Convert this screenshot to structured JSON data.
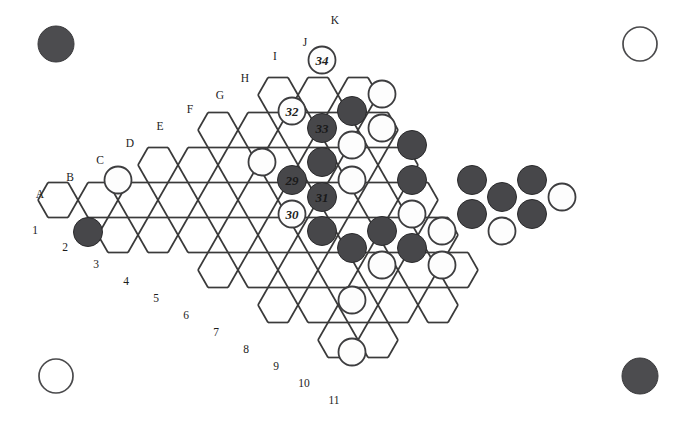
{
  "board": {
    "title": "Hexagonal board game position",
    "geometry": {
      "hex_width": 40,
      "hex_height": 35,
      "origin_x": 58,
      "origin_y": 200,
      "rows": 11,
      "row_lengths": [
        1,
        3,
        5,
        7,
        9,
        11,
        13,
        15,
        17,
        15,
        13
      ]
    },
    "column_labels": [
      "A",
      "B",
      "C",
      "D",
      "E",
      "F",
      "G",
      "H",
      "I",
      "J",
      "K"
    ],
    "row_labels": [
      "1",
      "2",
      "3",
      "4",
      "5",
      "6",
      "7",
      "8",
      "9",
      "10",
      "11"
    ],
    "colors": {
      "black_stone": "#47474a",
      "white_stone": "#fdfdfd",
      "grid_line": "#b9b9b9",
      "outline": "#3a3a3a",
      "background": "#ffffff"
    },
    "corner_markers": [
      {
        "name": "top-left-corner-stone",
        "color": "black",
        "cx": 56,
        "cy": 44,
        "r": 18
      },
      {
        "name": "top-right-corner-stone",
        "color": "white",
        "cx": 640,
        "cy": 44,
        "r": 17
      },
      {
        "name": "bottom-left-corner-stone",
        "color": "white",
        "cx": 56,
        "cy": 376,
        "r": 17
      },
      {
        "name": "bottom-right-corner-stone",
        "color": "black",
        "cx": 640,
        "cy": 376,
        "r": 18
      }
    ],
    "stones": [
      {
        "id": "s1",
        "color": "white",
        "label": "",
        "cx": 118,
        "cy": 180
      },
      {
        "id": "s2",
        "color": "black",
        "label": "",
        "cx": 88,
        "cy": 232
      },
      {
        "id": "s3",
        "color": "white",
        "label": "34",
        "cx": 322,
        "cy": 60
      },
      {
        "id": "s4",
        "color": "white",
        "label": "",
        "cx": 382,
        "cy": 94
      },
      {
        "id": "s5",
        "color": "white",
        "label": "32",
        "cx": 292,
        "cy": 111
      },
      {
        "id": "s6",
        "color": "black",
        "label": "33",
        "cx": 322,
        "cy": 128
      },
      {
        "id": "s7",
        "color": "black",
        "label": "",
        "cx": 352,
        "cy": 111
      },
      {
        "id": "s8",
        "color": "white",
        "label": "",
        "cx": 382,
        "cy": 128
      },
      {
        "id": "s9",
        "color": "black",
        "label": "",
        "cx": 412,
        "cy": 145
      },
      {
        "id": "s10",
        "color": "white",
        "label": "",
        "cx": 262,
        "cy": 162
      },
      {
        "id": "s11",
        "color": "black",
        "label": "",
        "cx": 322,
        "cy": 162
      },
      {
        "id": "s12",
        "color": "white",
        "label": "",
        "cx": 352,
        "cy": 145
      },
      {
        "id": "s13",
        "color": "black",
        "label": "29",
        "cx": 292,
        "cy": 180
      },
      {
        "id": "s14",
        "color": "black",
        "label": "31",
        "cx": 322,
        "cy": 197
      },
      {
        "id": "s15",
        "color": "white",
        "label": "",
        "cx": 352,
        "cy": 180
      },
      {
        "id": "s16",
        "color": "black",
        "label": "",
        "cx": 412,
        "cy": 180
      },
      {
        "id": "s17",
        "color": "black",
        "label": "",
        "cx": 472,
        "cy": 180
      },
      {
        "id": "s18",
        "color": "black",
        "label": "",
        "cx": 532,
        "cy": 180
      },
      {
        "id": "s19",
        "color": "black",
        "label": "",
        "cx": 502,
        "cy": 197
      },
      {
        "id": "s20",
        "color": "white",
        "label": "",
        "cx": 562,
        "cy": 197
      },
      {
        "id": "s21",
        "color": "white",
        "label": "30",
        "cx": 292,
        "cy": 214
      },
      {
        "id": "s22",
        "color": "black",
        "label": "",
        "cx": 322,
        "cy": 231
      },
      {
        "id": "s23",
        "color": "black",
        "label": "",
        "cx": 382,
        "cy": 231
      },
      {
        "id": "s24",
        "color": "white",
        "label": "",
        "cx": 412,
        "cy": 214
      },
      {
        "id": "s25",
        "color": "white",
        "label": "",
        "cx": 442,
        "cy": 231
      },
      {
        "id": "s26",
        "color": "black",
        "label": "",
        "cx": 472,
        "cy": 214
      },
      {
        "id": "s27",
        "color": "white",
        "label": "",
        "cx": 502,
        "cy": 231
      },
      {
        "id": "s28",
        "color": "black",
        "label": "",
        "cx": 532,
        "cy": 214
      },
      {
        "id": "s29",
        "color": "black",
        "label": "",
        "cx": 352,
        "cy": 248
      },
      {
        "id": "s30",
        "color": "white",
        "label": "",
        "cx": 382,
        "cy": 265
      },
      {
        "id": "s31",
        "color": "black",
        "label": "",
        "cx": 412,
        "cy": 248
      },
      {
        "id": "s32",
        "color": "white",
        "label": "",
        "cx": 442,
        "cy": 265
      },
      {
        "id": "s33",
        "color": "white",
        "label": "",
        "cx": 352,
        "cy": 300
      },
      {
        "id": "s34",
        "color": "white",
        "label": "",
        "cx": 352,
        "cy": 352
      }
    ],
    "top_left_labels": [
      {
        "text": "A",
        "x": 40,
        "y": 194
      },
      {
        "text": "B",
        "x": 70,
        "y": 177
      },
      {
        "text": "C",
        "x": 100,
        "y": 160
      },
      {
        "text": "D",
        "x": 130,
        "y": 143
      },
      {
        "text": "E",
        "x": 160,
        "y": 126
      },
      {
        "text": "F",
        "x": 190,
        "y": 109
      },
      {
        "text": "G",
        "x": 220,
        "y": 95
      },
      {
        "text": "H",
        "x": 245,
        "y": 78
      },
      {
        "text": "I",
        "x": 275,
        "y": 56
      },
      {
        "text": "J",
        "x": 305,
        "y": 42
      },
      {
        "text": "K",
        "x": 335,
        "y": 20
      }
    ],
    "bottom_left_labels": [
      {
        "text": "1",
        "x": 35,
        "y": 230
      },
      {
        "text": "2",
        "x": 65,
        "y": 247
      },
      {
        "text": "3",
        "x": 96,
        "y": 264
      },
      {
        "text": "4",
        "x": 126,
        "y": 281
      },
      {
        "text": "5",
        "x": 156,
        "y": 298
      },
      {
        "text": "6",
        "x": 186,
        "y": 315
      },
      {
        "text": "7",
        "x": 216,
        "y": 332
      },
      {
        "text": "8",
        "x": 246,
        "y": 349
      },
      {
        "text": "9",
        "x": 276,
        "y": 366
      },
      {
        "text": "10",
        "x": 304,
        "y": 383
      },
      {
        "text": "11",
        "x": 334,
        "y": 400
      }
    ]
  }
}
